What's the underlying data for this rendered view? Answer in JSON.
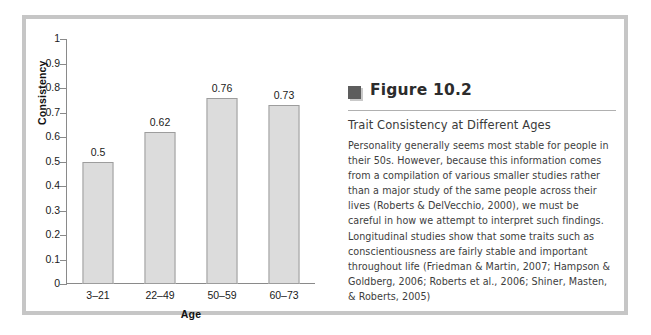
{
  "figure": {
    "icon_name": "book-marker-icon",
    "number_label": "Figure 10.2",
    "subtitle": "Trait Consistency at Different Ages",
    "body": "Personality generally seems most stable for people in their 50s. However, because this information comes from a compilation of various smaller studies rather than a major study of the same people across their lives (Roberts & DelVecchio, 2000), we must be careful in how we attempt to interpret such findings. Longitudinal studies show that some traits such as conscientiousness are fairly stable and important throughout life (Friedman & Martin, 2007; Hampson & Goldberg, 2006; Roberts et al., 2006; Shiner, Masten, & Roberts, 2005)"
  },
  "colors": {
    "bar_fill": "#dcdcdc",
    "bar_stroke": "#9d9d9d",
    "axis": "#8a8a8a",
    "frame": "#c6c6c6",
    "text": "#1a1a1a"
  },
  "chart_data": {
    "type": "bar",
    "title": "",
    "xlabel": "Age",
    "ylabel": "Consistency",
    "categories": [
      "3–21",
      "22–49",
      "50–59",
      "60–73"
    ],
    "values": [
      0.5,
      0.62,
      0.76,
      0.73
    ],
    "value_labels": [
      "0.5",
      "0.62",
      "0.76",
      "0.73"
    ],
    "ylim": [
      0,
      1
    ],
    "yticks": [
      0,
      0.1,
      0.2,
      0.3,
      0.4,
      0.5,
      0.6,
      0.7,
      0.8,
      0.9,
      1
    ],
    "ytick_labels": [
      "0",
      "0.1",
      "0.2",
      "0.3",
      "0.4",
      "0.5",
      "0.6",
      "0.7",
      "0.8",
      "0.9",
      "1"
    ],
    "grid": false,
    "legend": null
  }
}
